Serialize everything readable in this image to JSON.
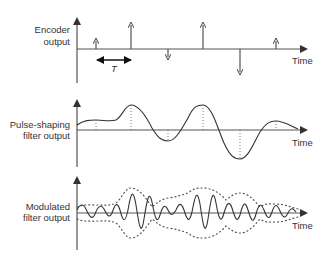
{
  "panels": [
    {
      "id": "encoder",
      "label_line1": "Encoder",
      "label_line2": "output",
      "time_label": "Time",
      "period_label": "T",
      "impulses": [
        {
          "x": 96,
          "sign": "up",
          "height": "small"
        },
        {
          "x": 131,
          "sign": "up",
          "height": "large"
        },
        {
          "x": 168,
          "sign": "down",
          "height": "small"
        },
        {
          "x": 203,
          "sign": "up",
          "height": "large"
        },
        {
          "x": 240,
          "sign": "down",
          "height": "large"
        },
        {
          "x": 276,
          "sign": "up",
          "height": "small"
        }
      ]
    },
    {
      "id": "pulse-shaping",
      "label_line1": "Pulse-shaping",
      "label_line2": "filter output",
      "time_label": "Time"
    },
    {
      "id": "modulated",
      "label_line1": "Modulated",
      "label_line2": "filter output",
      "time_label": "Time"
    }
  ],
  "colors": {
    "line": "#333333",
    "axis": "#555555",
    "background": "#ffffff"
  }
}
